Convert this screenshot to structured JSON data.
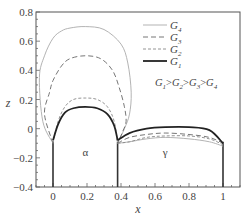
{
  "chart_data": {
    "type": "line",
    "title": "",
    "xlabel": "x",
    "ylabel": "z",
    "xlim": [
      -0.1,
      1.1
    ],
    "ylim": [
      -0.4,
      0.8
    ],
    "xticks": [
      "0",
      "0.2",
      "0.4",
      "0.6",
      "0.8",
      "1"
    ],
    "yticks": [
      "-0.4",
      "-0.2",
      "0",
      "0.2",
      "0.4",
      "0.6",
      "0.8"
    ],
    "grid": false,
    "legend_position": "upper right",
    "annotation": "G1>G2>G3>G4",
    "region_labels": [
      {
        "text": "α",
        "x": 0.19,
        "z": -0.16
      },
      {
        "text": "γ",
        "x": 0.66,
        "z": -0.16
      }
    ],
    "grain_boundaries_x": [
      0,
      0.38,
      1.0
    ],
    "series": [
      {
        "name": "G4",
        "style": "thin solid light gray",
        "x": [
          -0.1,
          -0.08,
          -0.05,
          0.0,
          0.05,
          0.1,
          0.19,
          0.3,
          0.4,
          0.44,
          0.46,
          0.45,
          0.42,
          0.38,
          0.45,
          0.55,
          0.66,
          0.8,
          0.92,
          1.0
        ],
        "z": [
          0.1,
          0.35,
          0.5,
          0.62,
          0.67,
          0.69,
          0.7,
          0.68,
          0.58,
          0.45,
          0.25,
          0.1,
          0.0,
          -0.1,
          -0.09,
          -0.07,
          -0.06,
          -0.07,
          -0.09,
          -0.12
        ]
      },
      {
        "name": "G3",
        "style": "long dashed",
        "x": [
          -0.05,
          -0.02,
          0.0,
          0.05,
          0.1,
          0.19,
          0.28,
          0.35,
          0.39,
          0.42,
          0.43,
          0.41,
          0.38,
          0.45,
          0.55,
          0.66,
          0.8,
          0.92,
          1.0
        ],
        "z": [
          0.1,
          0.25,
          0.33,
          0.43,
          0.48,
          0.5,
          0.48,
          0.4,
          0.28,
          0.15,
          0.05,
          -0.02,
          -0.1,
          -0.06,
          -0.04,
          -0.03,
          -0.04,
          -0.06,
          -0.1
        ],
        "note": "ends at lower-left near (-0.05,0.1) then to (0,-0.1)"
      },
      {
        "name": "G2",
        "style": "dashed",
        "x": [
          0.0,
          0.03,
          0.07,
          0.12,
          0.19,
          0.26,
          0.32,
          0.36,
          0.38,
          0.45,
          0.55,
          0.66,
          0.8,
          0.92,
          1.0
        ],
        "z": [
          -0.1,
          0.05,
          0.15,
          0.2,
          0.21,
          0.2,
          0.15,
          0.05,
          -0.1,
          -0.09,
          -0.06,
          -0.05,
          -0.05,
          -0.07,
          -0.11
        ]
      },
      {
        "name": "G1",
        "style": "thick solid",
        "x": [
          0.0,
          0.03,
          0.07,
          0.12,
          0.19,
          0.26,
          0.32,
          0.36,
          0.38,
          0.45,
          0.55,
          0.66,
          0.8,
          0.92,
          1.0
        ],
        "z": [
          -0.08,
          0.03,
          0.11,
          0.14,
          0.15,
          0.14,
          0.1,
          0.02,
          -0.08,
          -0.03,
          0.0,
          0.01,
          0.01,
          -0.01,
          -0.1
        ]
      }
    ]
  },
  "legend": [
    {
      "label": "G",
      "sub": "4",
      "style": "g4"
    },
    {
      "label": "G",
      "sub": "3",
      "style": "g3"
    },
    {
      "label": "G",
      "sub": "2",
      "style": "g2"
    },
    {
      "label": "G",
      "sub": "1",
      "style": "g1"
    }
  ],
  "annotation_parts": [
    "G",
    "1",
    ">",
    "G",
    "2",
    ">",
    "G",
    "3",
    ">",
    "G",
    "4"
  ],
  "axis": {
    "xlabel": "x",
    "ylabel": "z"
  },
  "regions": {
    "alpha": "α",
    "gamma": "γ"
  }
}
